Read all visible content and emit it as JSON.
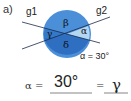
{
  "label": "a)",
  "lines": {
    "g1": "g1",
    "g2": "g2"
  },
  "angles": {
    "alpha": "α",
    "beta": "β",
    "gamma": "γ",
    "delta": "δ"
  },
  "given": "α = 30°",
  "answer": {
    "prefix": "α =",
    "value1": "30°",
    "equals": "=",
    "value2": "γ"
  },
  "colors": {
    "circle": "#4a90d9",
    "dark": "#2d6fc0",
    "light": "#a8d0f0"
  }
}
